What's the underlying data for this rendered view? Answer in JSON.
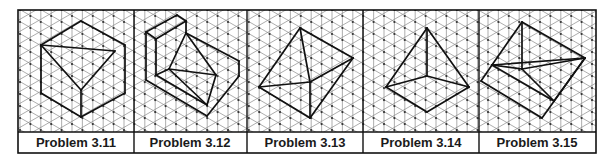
{
  "figure": {
    "grid_type": "isometric",
    "line_color": "#111111",
    "grid_color": "#8a8a8a",
    "panels": [
      {
        "label": "Problem 3.11",
        "shape": "hexagonal cube outline with inscribed tetrahedron",
        "vertices": {
          "T": [
            81,
            21
          ],
          "UL": [
            41,
            45
          ],
          "LL": [
            41,
            93
          ],
          "B": [
            81,
            117
          ],
          "LR": [
            125,
            93
          ],
          "UR": [
            125,
            45
          ],
          "R": [
            115,
            51
          ],
          "C": [
            81,
            90
          ]
        },
        "edges": [
          [
            "T",
            "UL"
          ],
          [
            "UL",
            "LL"
          ],
          [
            "LL",
            "B"
          ],
          [
            "B",
            "LR"
          ],
          [
            "LR",
            "UR"
          ],
          [
            "UR",
            "T"
          ],
          [
            "UL",
            "R"
          ],
          [
            "R",
            "C"
          ],
          [
            "C",
            "UL"
          ],
          [
            "C",
            "B"
          ]
        ]
      },
      {
        "label": "Problem 3.12",
        "shape": "stepped block with inscribed pyramid",
        "vertices": {
          "A": [
            146,
            32
          ],
          "B": [
            177,
            15
          ],
          "C": [
            186,
            21
          ],
          "D": [
            156,
            39
          ],
          "E": [
            186,
            33
          ],
          "F": [
            239,
            61
          ],
          "G": [
            239,
            76
          ],
          "H": [
            207,
            116
          ],
          "I": [
            146,
            80
          ],
          "J": [
            156,
            75
          ],
          "K": [
            169,
            69
          ],
          "L": [
            216,
            75
          ],
          "M": [
            207,
            105
          ]
        },
        "edges": [
          [
            "A",
            "B"
          ],
          [
            "B",
            "C"
          ],
          [
            "C",
            "D"
          ],
          [
            "D",
            "A"
          ],
          [
            "C",
            "E"
          ],
          [
            "E",
            "F"
          ],
          [
            "F",
            "G"
          ],
          [
            "G",
            "H"
          ],
          [
            "H",
            "I"
          ],
          [
            "I",
            "A"
          ],
          [
            "D",
            "J"
          ],
          [
            "J",
            "K"
          ],
          [
            "E",
            "K"
          ],
          [
            "E",
            "L"
          ],
          [
            "K",
            "L"
          ],
          [
            "K",
            "M"
          ],
          [
            "L",
            "M"
          ],
          [
            "J",
            "M"
          ]
        ]
      },
      {
        "label": "Problem 3.13",
        "shape": "block with attached pyramid",
        "vertices": {
          "P": [
            300,
            28
          ],
          "L": [
            259,
            87
          ],
          "C": [
            310,
            82
          ],
          "R": [
            353,
            58
          ],
          "B": [
            310,
            118
          ]
        },
        "edges": [
          [
            "P",
            "L"
          ],
          [
            "P",
            "C"
          ],
          [
            "P",
            "R"
          ],
          [
            "L",
            "C"
          ],
          [
            "C",
            "R"
          ],
          [
            "R",
            "B"
          ],
          [
            "B",
            "L"
          ],
          [
            "C",
            "B"
          ]
        ]
      },
      {
        "label": "Problem 3.14",
        "shape": "square pyramid",
        "vertices": {
          "P": [
            427,
            28
          ],
          "L": [
            386,
            87
          ],
          "C": [
            427,
            76
          ],
          "R": [
            469,
            87
          ],
          "B": [
            427,
            112
          ]
        },
        "edges": [
          [
            "P",
            "L"
          ],
          [
            "P",
            "C"
          ],
          [
            "P",
            "R"
          ],
          [
            "L",
            "C"
          ],
          [
            "C",
            "R"
          ],
          [
            "L",
            "B"
          ],
          [
            "R",
            "B"
          ]
        ]
      },
      {
        "label": "Problem 3.15",
        "shape": "wedge / prism in isometric",
        "vertices": {
          "T": [
            522,
            22
          ],
          "R": [
            585,
            58
          ],
          "LM": [
            492,
            65
          ],
          "C": [
            522,
            69
          ],
          "FL": [
            481,
            81
          ],
          "LR": [
            554,
            101
          ],
          "B": [
            542,
            118
          ]
        },
        "edges": [
          [
            "T",
            "R"
          ],
          [
            "T",
            "LM"
          ],
          [
            "T",
            "C"
          ],
          [
            "LM",
            "C"
          ],
          [
            "C",
            "R"
          ],
          [
            "LM",
            "R"
          ],
          [
            "R",
            "B"
          ],
          [
            "B",
            "FL"
          ],
          [
            "FL",
            "LM"
          ],
          [
            "C",
            "LR"
          ],
          [
            "LM",
            "LR"
          ],
          [
            "LR",
            "R"
          ]
        ]
      }
    ]
  }
}
